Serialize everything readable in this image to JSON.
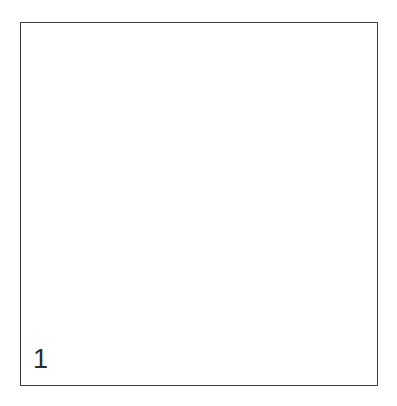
{
  "figure": {
    "label": "1",
    "caption": "",
    "type": "stippled-line-drawing",
    "colors": {
      "background": "#ffffff",
      "frame_border": "#3a3a3a",
      "outline": "#2b2b2b",
      "stipple": "#555555",
      "label_text": "#2b2b2b"
    },
    "frame": {
      "x": 20,
      "y": 22,
      "width": 358,
      "height": 364,
      "stroke_width": 1.6
    }
  },
  "chart_data": {
    "type": "line",
    "title": "",
    "xlabel": "",
    "ylabel": "",
    "grid": false,
    "legend": "none",
    "xlim": [
      0,
      397
    ],
    "ylim": [
      0,
      406
    ],
    "annotations": [
      {
        "text": "1",
        "x": 33,
        "y": 370
      }
    ],
    "series": [
      {
        "name": "upper-lobe-outline",
        "closed": true,
        "points": [
          [
            175,
            48
          ],
          [
            160,
            52
          ],
          [
            148,
            58
          ],
          [
            138,
            62
          ],
          [
            128,
            62
          ],
          [
            120,
            61
          ],
          [
            118,
            72
          ],
          [
            118,
            82
          ],
          [
            113,
            84
          ],
          [
            108,
            88
          ],
          [
            104,
            95
          ],
          [
            103,
            108
          ],
          [
            104,
            124
          ],
          [
            106,
            140
          ],
          [
            109,
            155
          ],
          [
            112,
            168
          ],
          [
            115,
            178
          ],
          [
            121,
            184
          ],
          [
            131,
            192
          ],
          [
            143,
            200
          ],
          [
            157,
            207
          ],
          [
            172,
            212
          ],
          [
            187,
            215
          ],
          [
            202,
            216
          ],
          [
            217,
            214
          ],
          [
            232,
            210
          ],
          [
            246,
            204
          ],
          [
            258,
            196
          ],
          [
            267,
            188
          ],
          [
            273,
            180
          ],
          [
            276,
            172
          ],
          [
            279,
            162
          ],
          [
            284,
            150
          ],
          [
            290,
            136
          ],
          [
            296,
            120
          ],
          [
            299,
            106
          ],
          [
            298,
            94
          ],
          [
            293,
            84
          ],
          [
            285,
            75
          ],
          [
            274,
            67
          ],
          [
            261,
            60
          ],
          [
            247,
            55
          ],
          [
            233,
            52
          ],
          [
            219,
            51
          ],
          [
            205,
            51
          ],
          [
            193,
            50
          ],
          [
            184,
            48
          ]
        ]
      },
      {
        "name": "lower-lobe-outline",
        "closed": true,
        "points": [
          [
            113,
            178
          ],
          [
            105,
            186
          ],
          [
            99,
            196
          ],
          [
            94,
            208
          ],
          [
            90,
            222
          ],
          [
            88,
            238
          ],
          [
            88,
            254
          ],
          [
            89,
            270
          ],
          [
            93,
            286
          ],
          [
            99,
            300
          ],
          [
            108,
            314
          ],
          [
            119,
            327
          ],
          [
            132,
            339
          ],
          [
            146,
            349
          ],
          [
            161,
            356
          ],
          [
            176,
            361
          ],
          [
            191,
            363
          ],
          [
            206,
            362
          ],
          [
            221,
            358
          ],
          [
            236,
            351
          ],
          [
            250,
            342
          ],
          [
            263,
            331
          ],
          [
            275,
            318
          ],
          [
            285,
            304
          ],
          [
            292,
            289
          ],
          [
            297,
            273
          ],
          [
            300,
            256
          ],
          [
            300,
            239
          ],
          [
            298,
            222
          ],
          [
            294,
            207
          ],
          [
            289,
            195
          ],
          [
            283,
            186
          ],
          [
            277,
            179
          ],
          [
            272,
            182
          ],
          [
            265,
            190
          ],
          [
            255,
            198
          ],
          [
            243,
            206
          ],
          [
            229,
            212
          ],
          [
            214,
            216
          ],
          [
            199,
            217
          ],
          [
            183,
            216
          ],
          [
            167,
            212
          ],
          [
            152,
            206
          ],
          [
            138,
            199
          ],
          [
            127,
            191
          ],
          [
            119,
            184
          ]
        ]
      },
      {
        "name": "right-protrusion-outline",
        "closed": true,
        "points": [
          [
            276,
            172
          ],
          [
            285,
            176
          ],
          [
            296,
            180
          ],
          [
            307,
            183
          ],
          [
            317,
            185
          ],
          [
            324,
            186
          ],
          [
            321,
            189
          ],
          [
            312,
            190
          ],
          [
            301,
            190
          ],
          [
            291,
            188
          ],
          [
            283,
            185
          ],
          [
            277,
            181
          ],
          [
            274,
            177
          ]
        ]
      },
      {
        "name": "left-notch-detail",
        "closed": false,
        "points": [
          [
            120,
            61
          ],
          [
            118,
            72
          ],
          [
            118,
            82
          ],
          [
            113,
            84
          ],
          [
            108,
            88
          ]
        ]
      },
      {
        "name": "lobe-separation-ridge",
        "closed": false,
        "points": [
          [
            113,
            178
          ],
          [
            119,
            184
          ],
          [
            127,
            191
          ],
          [
            138,
            199
          ],
          [
            152,
            206
          ],
          [
            167,
            212
          ],
          [
            183,
            216
          ],
          [
            199,
            217
          ],
          [
            214,
            216
          ],
          [
            229,
            212
          ],
          [
            243,
            206
          ],
          [
            255,
            198
          ],
          [
            265,
            190
          ],
          [
            272,
            182
          ],
          [
            276,
            172
          ]
        ]
      }
    ]
  }
}
